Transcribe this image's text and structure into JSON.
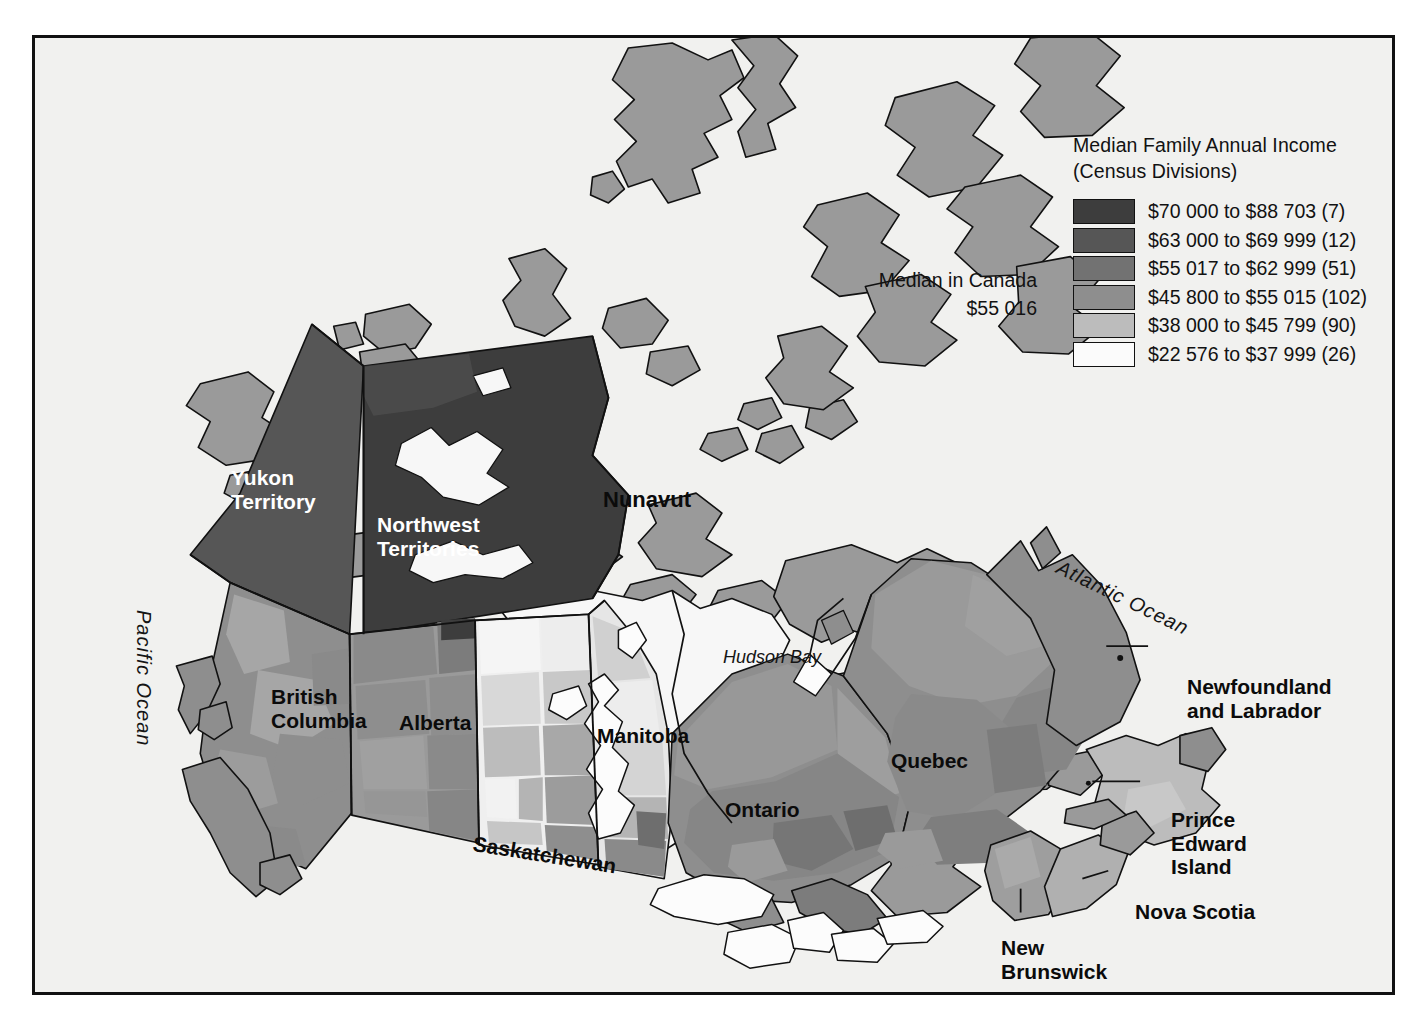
{
  "map": {
    "title_hidden": "",
    "background": "#f1f1ef",
    "frame_color": "#111111"
  },
  "legend": {
    "title_line1": "Median Family Annual Income",
    "title_line2": "(Census Divisions)",
    "items": [
      {
        "color": "#3d3d3d",
        "label": "$70 000 to $88 703 (7)",
        "min": 70000,
        "max": 88703,
        "count": 7
      },
      {
        "color": "#565656",
        "label": "$63 000 to $69 999 (12)",
        "min": 63000,
        "max": 69999,
        "count": 12
      },
      {
        "color": "#727272",
        "label": "$55 017 to $62 999 (51)",
        "min": 55017,
        "max": 62999,
        "count": 51
      },
      {
        "color": "#8e8e8e",
        "label": "$45 800 to $55 015 (102)",
        "min": 45800,
        "max": 55015,
        "count": 102
      },
      {
        "color": "#bcbcbc",
        "label": "$38 000 to $45 799 (90)",
        "min": 38000,
        "max": 45799,
        "count": 90
      },
      {
        "color": "#fbfbfb",
        "label": "$22 576 to $37 999 (26)",
        "min": 22576,
        "max": 37999,
        "count": 26
      }
    ]
  },
  "median_note": {
    "line1": "Median in Canada",
    "line2": "$55 016"
  },
  "places": {
    "yukon": "Yukon\nTerritory",
    "nwt": "Northwest\nTerritories",
    "nunavut": "Nunavut",
    "bc": "British\nColumbia",
    "alberta": "Alberta",
    "saskatchewan": "Saskatchewan",
    "manitoba": "Manitoba",
    "ontario": "Ontario",
    "quebec": "Quebec",
    "newfoundland": "Newfoundland\nand Labrador",
    "pei": "Prince\nEdward\nIsland",
    "nova_scotia": "Nova Scotia",
    "new_brunswick": "New\nBrunswick"
  },
  "water": {
    "atlantic": "Atlantic  Ocean",
    "pacific": "Pacific  Ocean",
    "hudson_bay": "Hudson Bay"
  },
  "chart_data": {
    "type": "choropleth-map",
    "title": "Median Family Annual Income (Census Divisions)",
    "region": "Canada",
    "unit": "CAD",
    "national_median": 55016,
    "classes": [
      {
        "range": "$70 000 to $88 703",
        "count": 7,
        "color": "#3d3d3d"
      },
      {
        "range": "$63 000 to $69 999",
        "count": 12,
        "color": "#565656"
      },
      {
        "range": "$55 017 to $62 999",
        "count": 51,
        "color": "#727272"
      },
      {
        "range": "$45 800 to $55 015",
        "count": 102,
        "color": "#8e8e8e"
      },
      {
        "range": "$38 000 to $45 799",
        "count": 90,
        "color": "#bcbcbc"
      },
      {
        "range": "$22 576 to $37 999",
        "count": 26,
        "color": "#fbfbfb"
      }
    ],
    "total_census_divisions": 288
  }
}
